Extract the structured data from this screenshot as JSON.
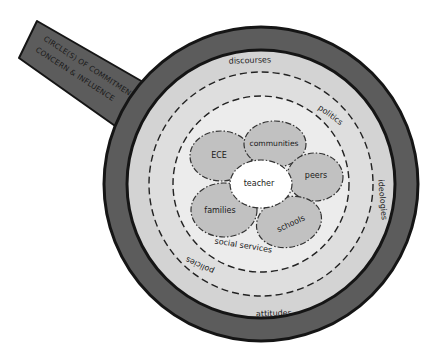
{
  "diagram": {
    "handle_label": {
      "line1": "CIRCLE(S) OF COMMITMENT,",
      "line2": "CONCERN & INFLUENCE"
    },
    "rings": {
      "outer_top": "discourses",
      "outer_bottom": "attitudes",
      "right": "ideologies",
      "middle_top": "politics",
      "middle_bottom": "policies",
      "inner": "social services"
    },
    "center": "teacher",
    "petals": [
      {
        "label": "ECE"
      },
      {
        "label": "communities"
      },
      {
        "label": "peers"
      },
      {
        "label": "schools"
      },
      {
        "label": "families"
      }
    ],
    "colors": {
      "dark_band": "#5c5c5c",
      "border": "#151515",
      "light_band": "#d3d3d3",
      "middle_band": "#dedede",
      "inner_area": "#ececec",
      "petal": "#c1c1c1",
      "center": "#ffffff"
    }
  }
}
